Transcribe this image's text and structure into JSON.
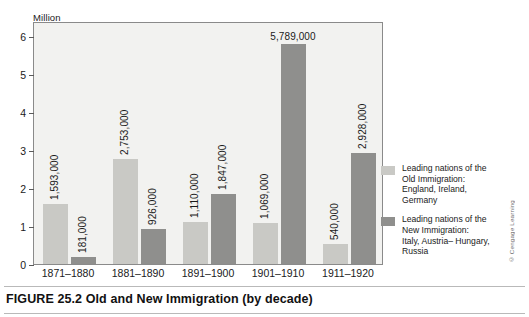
{
  "figure": {
    "caption_label": "FIGURE 25.2",
    "caption_title": "Old and New Immigration (by decade)",
    "credit": "© Cengage Learning"
  },
  "chart_data": {
    "type": "bar",
    "title": "Old and New Immigration (by decade)",
    "xlabel": "",
    "ylabel": "Million",
    "ylim": [
      0,
      6.4
    ],
    "yticks": [
      0,
      1,
      2,
      3,
      4,
      5,
      6
    ],
    "ytick_labels": [
      "0",
      "1",
      "2",
      "3",
      "4",
      "5",
      "6"
    ],
    "grid": false,
    "legend_position": "right",
    "categories": [
      "1871–1880",
      "1881–1890",
      "1891–1900",
      "1901–1910",
      "1911–1920"
    ],
    "series": [
      {
        "name": "Old Immigration",
        "color": "#c9c9c5",
        "legend_label": "Leading nations of the Old Immigration: England, Ireland, Germany",
        "values": [
          1593000,
          2753000,
          1110000,
          1069000,
          540000
        ],
        "value_labels": [
          "1,593,000",
          "2,753,000",
          "1,110,000",
          "1,069,000",
          "540,000"
        ]
      },
      {
        "name": "New Immigration",
        "color": "#8f8f8d",
        "legend_label": "Leading nations of the New Immigration: Italy, Austria– Hungary, Russia",
        "values": [
          181000,
          926000,
          1847000,
          5789000,
          2928000
        ],
        "value_labels": [
          "181,000",
          "926,000",
          "1,847,000",
          "5,789,000",
          "2,928,000"
        ]
      }
    ]
  },
  "legend": {
    "items": [
      {
        "swatch": "old",
        "lines": [
          "Leading nations of the",
          "Old Immigration:",
          "England, Ireland,",
          "Germany"
        ]
      },
      {
        "swatch": "new",
        "lines": [
          "Leading nations of the",
          "New Immigration:",
          "Italy, Austria– Hungary,",
          "Russia"
        ]
      }
    ]
  }
}
